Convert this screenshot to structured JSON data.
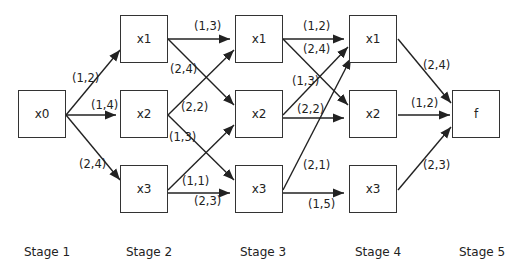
{
  "nodes": [
    {
      "id": "x0",
      "label": "x0",
      "stage": 1
    },
    {
      "id": "s2x1",
      "label": "x1",
      "stage": 2
    },
    {
      "id": "s2x2",
      "label": "x2",
      "stage": 2
    },
    {
      "id": "s2x3",
      "label": "x3",
      "stage": 2
    },
    {
      "id": "s3x1",
      "label": "x1",
      "stage": 3
    },
    {
      "id": "s3x2",
      "label": "x2",
      "stage": 3
    },
    {
      "id": "s3x3",
      "label": "x3",
      "stage": 3
    },
    {
      "id": "s4x1",
      "label": "x1",
      "stage": 4
    },
    {
      "id": "s4x2",
      "label": "x2",
      "stage": 4
    },
    {
      "id": "s4x3",
      "label": "x3",
      "stage": 4
    },
    {
      "id": "f",
      "label": "f",
      "stage": 5
    }
  ],
  "edges": [
    {
      "from": "x0",
      "to": "s2x1",
      "label": "(1,2)"
    },
    {
      "from": "x0",
      "to": "s2x2",
      "label": "(1,4)"
    },
    {
      "from": "x0",
      "to": "s2x3",
      "label": "(2,4)"
    },
    {
      "from": "s2x1",
      "to": "s3x1",
      "label": "(1,3)"
    },
    {
      "from": "s2x1",
      "to": "s3x2",
      "label": "(2,4)"
    },
    {
      "from": "s2x2",
      "to": "s3x1",
      "label": "(2,2)"
    },
    {
      "from": "s2x2",
      "to": "s3x3",
      "label": "(1,3)"
    },
    {
      "from": "s2x3",
      "to": "s3x2",
      "label": "(1,1)"
    },
    {
      "from": "s2x3",
      "to": "s3x3",
      "label": "(2,3)"
    },
    {
      "from": "s3x1",
      "to": "s4x1",
      "label": "(1,2)"
    },
    {
      "from": "s3x1",
      "to": "s4x2",
      "label": "(2,4)"
    },
    {
      "from": "s3x2",
      "to": "s4x1",
      "label": "(1,3)"
    },
    {
      "from": "s3x2",
      "to": "s4x2",
      "label": "(2,2)"
    },
    {
      "from": "s3x3",
      "to": "s4x1",
      "label": "(2,1)"
    },
    {
      "from": "s3x3",
      "to": "s4x3",
      "label": "(1,5)"
    },
    {
      "from": "s4x1",
      "to": "f",
      "label": "(2,4)"
    },
    {
      "from": "s4x2",
      "to": "f",
      "label": "(1,2)"
    },
    {
      "from": "s4x3",
      "to": "f",
      "label": "(2,3)"
    }
  ],
  "stages": [
    "Stage 1",
    "Stage 2",
    "Stage 3",
    "Stage 4",
    "Stage 5"
  ]
}
